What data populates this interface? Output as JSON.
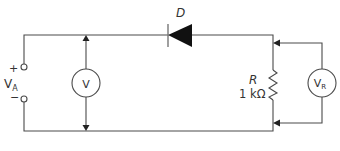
{
  "diagram": {
    "type": "circuit",
    "source": {
      "label": "V",
      "subscript": "A",
      "plus": "+",
      "minus": "−"
    },
    "voltmeter_source": {
      "label": "V"
    },
    "diode": {
      "label": "D",
      "orientation": "cathode-left"
    },
    "resistor": {
      "label": "R",
      "value": "1 kΩ"
    },
    "voltmeter_resistor": {
      "label": "V",
      "subscript": "R"
    },
    "colors": {
      "line": "#4a4a4a",
      "text": "#333333",
      "diode_fill": "#111111"
    }
  }
}
